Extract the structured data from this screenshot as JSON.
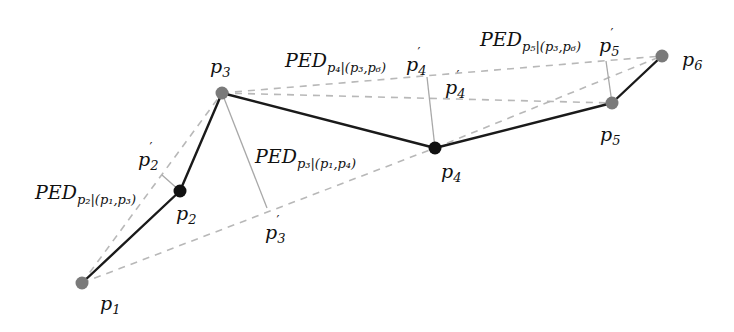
{
  "diagram": {
    "type": "trajectory-ped-illustration",
    "colors": {
      "background": "#ffffff",
      "trajectory_line": "#1a1a1a",
      "dashed_line": "#b8b8b8",
      "perpendicular_line": "#a8a8a8",
      "point_gray": "#7a7a7a",
      "point_black": "#111111",
      "text": "#111111"
    },
    "points": [
      {
        "id": "p1",
        "label": "p",
        "sub": "1",
        "x": 82,
        "y": 283,
        "fill": "gray",
        "label_x": 100,
        "label_y": 310
      },
      {
        "id": "p2",
        "label": "p",
        "sub": "2",
        "x": 180,
        "y": 191,
        "fill": "black",
        "label_x": 176,
        "label_y": 220
      },
      {
        "id": "p3",
        "label": "p",
        "sub": "3",
        "x": 222,
        "y": 93,
        "fill": "gray",
        "label_x": 210,
        "label_y": 73
      },
      {
        "id": "p4",
        "label": "p",
        "sub": "4",
        "x": 435,
        "y": 148,
        "fill": "black",
        "label_x": 441,
        "label_y": 178
      },
      {
        "id": "p5",
        "label": "p",
        "sub": "5",
        "x": 612,
        "y": 103,
        "fill": "gray",
        "label_x": 600,
        "label_y": 141
      },
      {
        "id": "p6",
        "label": "p",
        "sub": "6",
        "x": 662,
        "y": 56,
        "fill": "gray",
        "label_x": 682,
        "label_y": 66
      }
    ],
    "projected_points": [
      {
        "id": "p2prime",
        "label": "p",
        "sub": "2",
        "prime": "′",
        "x": 162,
        "y": 175,
        "label_x": 138,
        "label_y": 166
      },
      {
        "id": "p3prime",
        "label": "p",
        "sub": "3",
        "prime": "′",
        "x": 267,
        "y": 208,
        "label_x": 265,
        "label_y": 239
      },
      {
        "id": "p4prime",
        "label": "p",
        "sub": "4",
        "prime": "′",
        "x": 427,
        "y": 77,
        "label_x": 406,
        "label_y": 71
      },
      {
        "id": "p4prime2",
        "label": "p",
        "sub": "4",
        "prime": "′",
        "x": 445,
        "y": 93,
        "label_x": 445,
        "label_y": 94
      },
      {
        "id": "p5prime",
        "label": "p",
        "sub": "5",
        "prime": "′",
        "x": 606,
        "y": 61,
        "label_x": 599,
        "label_y": 52
      }
    ],
    "ped_labels": [
      {
        "id": "ped-p2",
        "main": "PED",
        "sub": "p₂|(p₁,p₃)",
        "x": 35,
        "y": 199
      },
      {
        "id": "ped-p3",
        "main": "PED",
        "sub": "p₃|(p₁,p₄)",
        "x": 255,
        "y": 163
      },
      {
        "id": "ped-p4",
        "main": "PED",
        "sub": "p₄|(p₃,p₆)",
        "x": 285,
        "y": 67
      },
      {
        "id": "ped-p5",
        "main": "PED",
        "sub": "p₅|(p₃,p₆)",
        "x": 480,
        "y": 46
      }
    ],
    "trajectory_segments": [
      [
        "p1",
        "p2"
      ],
      [
        "p2",
        "p3"
      ],
      [
        "p3",
        "p4"
      ],
      [
        "p4",
        "p5"
      ],
      [
        "p5",
        "p6"
      ]
    ],
    "dashed_segments": [
      [
        "p1",
        "p3"
      ],
      [
        "p1",
        "p4"
      ],
      [
        "p3",
        "p6"
      ],
      [
        "p3",
        "p5"
      ],
      [
        "p4",
        "p6"
      ]
    ],
    "perpendicular_segments": [
      [
        "p2",
        "p2prime"
      ],
      [
        "p3",
        "p3prime"
      ],
      [
        "p4",
        "p4prime"
      ],
      [
        "p5",
        "p5prime"
      ]
    ]
  }
}
